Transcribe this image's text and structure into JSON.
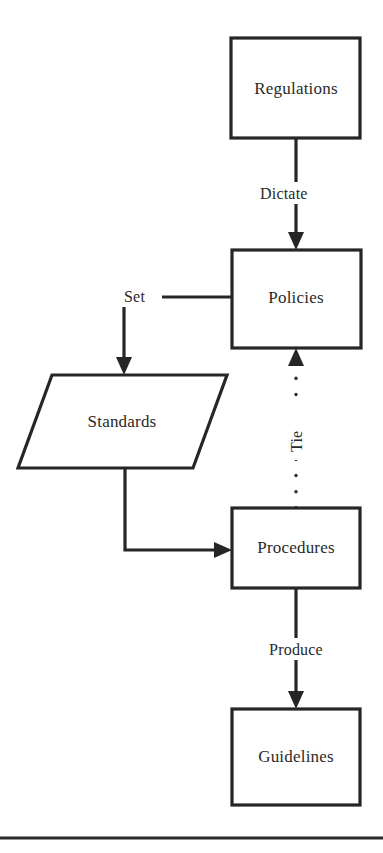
{
  "diagram": {
    "shape_colors": {
      "fill": "#ffffff",
      "stroke": "#262626",
      "text": "#2a2a2a"
    },
    "nodes": [
      {
        "id": "regulations",
        "label": "Regulations",
        "shape": "rectangle"
      },
      {
        "id": "policies",
        "label": "Policies",
        "shape": "rectangle"
      },
      {
        "id": "standards",
        "label": "Standards",
        "shape": "parallelogram"
      },
      {
        "id": "procedures",
        "label": "Procedures",
        "shape": "rectangle"
      },
      {
        "id": "guidelines",
        "label": "Guidelines",
        "shape": "rectangle"
      }
    ],
    "edges": [
      {
        "id": "regulations-policies",
        "from": "regulations",
        "to": "policies",
        "label": "Dictate",
        "style": "solid",
        "arrow": "down"
      },
      {
        "id": "policies-standards",
        "from": "policies",
        "to": "standards",
        "label": "Set",
        "style": "solid",
        "arrow": "down"
      },
      {
        "id": "standards-procedures",
        "from": "standards",
        "to": "procedures",
        "label": "",
        "style": "solid",
        "arrow": "right"
      },
      {
        "id": "procedures-policies",
        "from": "procedures",
        "to": "policies",
        "label": "Tie",
        "style": "dotted",
        "arrow": "up"
      },
      {
        "id": "procedures-guidelines",
        "from": "procedures",
        "to": "guidelines",
        "label": "Produce",
        "style": "solid",
        "arrow": "down"
      }
    ]
  }
}
